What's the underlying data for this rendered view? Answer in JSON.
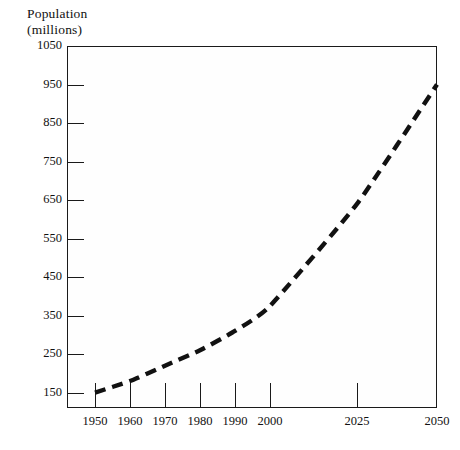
{
  "figure": {
    "axis_title_lines": [
      "Population",
      "(millions)"
    ],
    "caption": ""
  },
  "chart_data": {
    "type": "line",
    "title": "Population (millions)",
    "xlabel": "",
    "ylabel": "Population (millions)",
    "x": [
      1950,
      1960,
      1970,
      1980,
      1990,
      2000,
      2025,
      2050
    ],
    "xtick_labels": [
      "1950",
      "1960",
      "1970",
      "1980",
      "1990",
      "2000",
      "2025",
      "2050"
    ],
    "xtick_positions_px": [
      28,
      63,
      98,
      133,
      168,
      203,
      290,
      370
    ],
    "values": [
      150,
      180,
      220,
      260,
      310,
      375,
      640,
      950
    ],
    "ytick_labels": [
      "150",
      "250",
      "350",
      "450",
      "550",
      "650",
      "750",
      "850",
      "950",
      "1050"
    ],
    "ytick_values": [
      150,
      250,
      350,
      450,
      550,
      650,
      750,
      850,
      950,
      1050
    ],
    "ylim": [
      110,
      1050
    ],
    "grid": false,
    "legend": null,
    "line_style": "dashed",
    "line_color": "#111111",
    "line_width_px": 4,
    "frame_color": "#1a1a1a",
    "background_color": "#ffffff",
    "axis_scale_note": "x axis spacing is non-linear: 1950-2000 in equal 10-year steps, then 2025 and 2050 in wider 25-year steps"
  }
}
